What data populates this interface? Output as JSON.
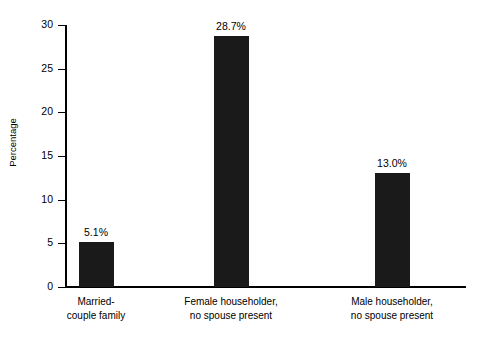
{
  "chart_data": {
    "type": "bar",
    "title": "",
    "subtitle": "",
    "xlabel": "",
    "ylabel": "Percentage",
    "ylim": [
      0,
      30
    ],
    "yticks": [
      0,
      5,
      10,
      15,
      20,
      25,
      30
    ],
    "ytick_labels": [
      "0",
      "5",
      "10",
      "15",
      "20",
      "25",
      "30"
    ],
    "grid": false,
    "legend": false,
    "categories": [
      "Married-couple family",
      "Female householder, no spouse present",
      "Male householder, no spouse present"
    ],
    "category_lines": [
      [
        "Married-",
        "couple family"
      ],
      [
        "Female householder,",
        "no spouse present"
      ],
      [
        "Male householder,",
        "no spouse present"
      ]
    ],
    "values": [
      5.1,
      28.7,
      13.0
    ],
    "data_labels": [
      "5.1%",
      "28.7%",
      "13.0%"
    ],
    "bar_color": "#1a1a1a",
    "axis_color": "#000000",
    "background_color": "#ffffff"
  }
}
